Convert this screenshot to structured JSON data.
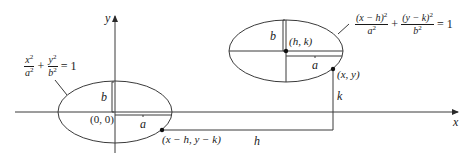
{
  "diagram": {
    "axes": {
      "x_label": "x",
      "y_label": "y"
    },
    "origin_ellipse": {
      "center_label": "(0, 0)",
      "a_label": "a",
      "b_label": "b",
      "equation": {
        "term1_num": "x",
        "term1_num_sup": "2",
        "term1_den": "a",
        "term1_den_sup": "2",
        "plus": "+",
        "term2_num": "y",
        "term2_num_sup": "2",
        "term2_den": "b",
        "term2_den_sup": "2",
        "equals": "= 1"
      },
      "point_label": "(x − h, y − k)"
    },
    "shifted_ellipse": {
      "center_label": "(h, k)",
      "a_label": "a",
      "b_label": "b",
      "equation": {
        "term1_num": "(x − h)",
        "term1_num_sup": "2",
        "term1_den": "a",
        "term1_den_sup": "2",
        "plus": "+",
        "term2_num": "(y − k)",
        "term2_num_sup": "2",
        "term2_den": "b",
        "term2_den_sup": "2",
        "equals": "= 1"
      },
      "point_label": "(x, y)"
    },
    "translation": {
      "h_label": "h",
      "k_label": "k"
    },
    "colors": {
      "stroke": "#3a3a3a",
      "text": "#1a1a1a",
      "background": "#ffffff"
    }
  }
}
